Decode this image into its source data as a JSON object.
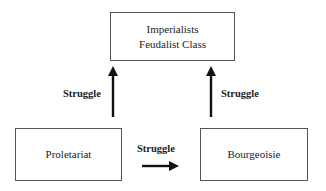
{
  "diagram": {
    "nodes": {
      "top": {
        "line1": "Imperialists",
        "line2": "Feudalist Class"
      },
      "left": {
        "label": "Proletariat"
      },
      "right": {
        "label": "Bourgeoisie"
      }
    },
    "edges": {
      "left_up": {
        "label": "Struggle",
        "from": "Proletariat",
        "to": "Imperialists Feudalist Class"
      },
      "right_up": {
        "label": "Struggle",
        "from": "Bourgeoisie",
        "to": "Imperialists Feudalist Class"
      },
      "horizontal": {
        "label": "Struggle",
        "from": "Proletariat",
        "to": "Bourgeoisie"
      }
    },
    "colors": {
      "arrow": "#111111",
      "border": "#555555",
      "text": "#222222"
    }
  }
}
